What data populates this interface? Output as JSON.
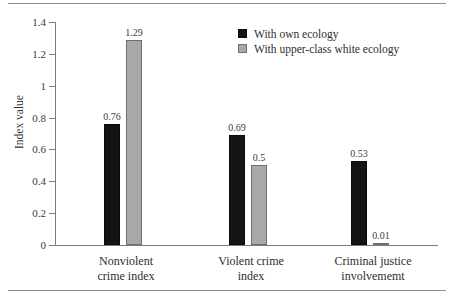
{
  "chart_data": {
    "type": "bar",
    "title": "",
    "subtitle": "",
    "xlabel": "",
    "ylabel": "Index value",
    "ylim": [
      0,
      1.4
    ],
    "ytick_labels": [
      "0",
      "0.2",
      "0.4",
      "0.6",
      "0.8",
      "1",
      "1.2",
      "1.4"
    ],
    "ytick_values": [
      0,
      0.2,
      0.4,
      0.6,
      0.8,
      1,
      1.2,
      1.4
    ],
    "grid": false,
    "legend_position": "top-right",
    "categories": [
      "Nonviolent\ncrime index",
      "Violent crime\nindex",
      "Criminal justice\ninvolvememt"
    ],
    "category_lines": [
      [
        "Nonviolent",
        "crime index"
      ],
      [
        "Violent crime",
        "index"
      ],
      [
        "Criminal justice",
        "involvememt"
      ]
    ],
    "series": [
      {
        "name": "With own ecology",
        "color": "#141414",
        "values": [
          0.76,
          0.69,
          0.53
        ],
        "labels": [
          "0.76",
          "0.69",
          "0.53"
        ]
      },
      {
        "name": "With upper-class white ecology",
        "color": "#a8a8a8",
        "values": [
          1.29,
          0.5,
          0.01
        ],
        "labels": [
          "1.29",
          "0.5",
          "0.01"
        ]
      }
    ]
  },
  "legend": {
    "items": [
      {
        "label": "With own ecology",
        "color": "#141414"
      },
      {
        "label": "With upper-class white ecology",
        "color": "#a8a8a8"
      }
    ]
  },
  "axis": {
    "y_title": "Index value"
  }
}
